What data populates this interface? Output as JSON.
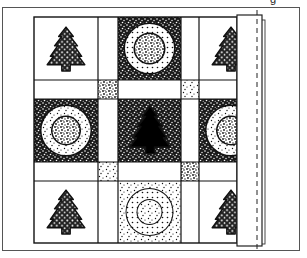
{
  "figure": {
    "type": "quilt-pattern-illustration",
    "caption_fragment": "g",
    "colors": {
      "background": "#ffffff",
      "line": "#1a1a1a",
      "frame": "#555555",
      "dark_fill": "#000000",
      "light_fill": "#ffffff"
    },
    "layout": {
      "grid": "3x3 blocks with sashing strips and 4 cornerstone squares",
      "blocks": [
        {
          "row": 1,
          "col": 1,
          "motif": "tree",
          "style": "stippled tree on white"
        },
        {
          "row": 1,
          "col": 2,
          "motif": "concentric-circles",
          "style": "dark stipple background, dotted ring, textured center"
        },
        {
          "row": 1,
          "col": 3,
          "motif": "tree",
          "style": "stippled tree on white, partially covered by binding"
        },
        {
          "row": 2,
          "col": 1,
          "motif": "concentric-circles",
          "style": "dark stipple background, dotted ring, textured center"
        },
        {
          "row": 2,
          "col": 2,
          "motif": "tree",
          "style": "solid black tree on dark stipple background"
        },
        {
          "row": 2,
          "col": 3,
          "motif": "concentric-circles",
          "style": "partially covered by binding"
        },
        {
          "row": 3,
          "col": 1,
          "motif": "tree",
          "style": "stippled tree on white"
        },
        {
          "row": 3,
          "col": 2,
          "motif": "concentric-circles",
          "style": "light stipple background, dotted ring"
        },
        {
          "row": 3,
          "col": 3,
          "motif": "tree",
          "style": "stippled tree on white, partially covered by binding"
        }
      ],
      "cornerstones": 4,
      "binding": "folded strip along right edge with dashed stitching line"
    }
  }
}
